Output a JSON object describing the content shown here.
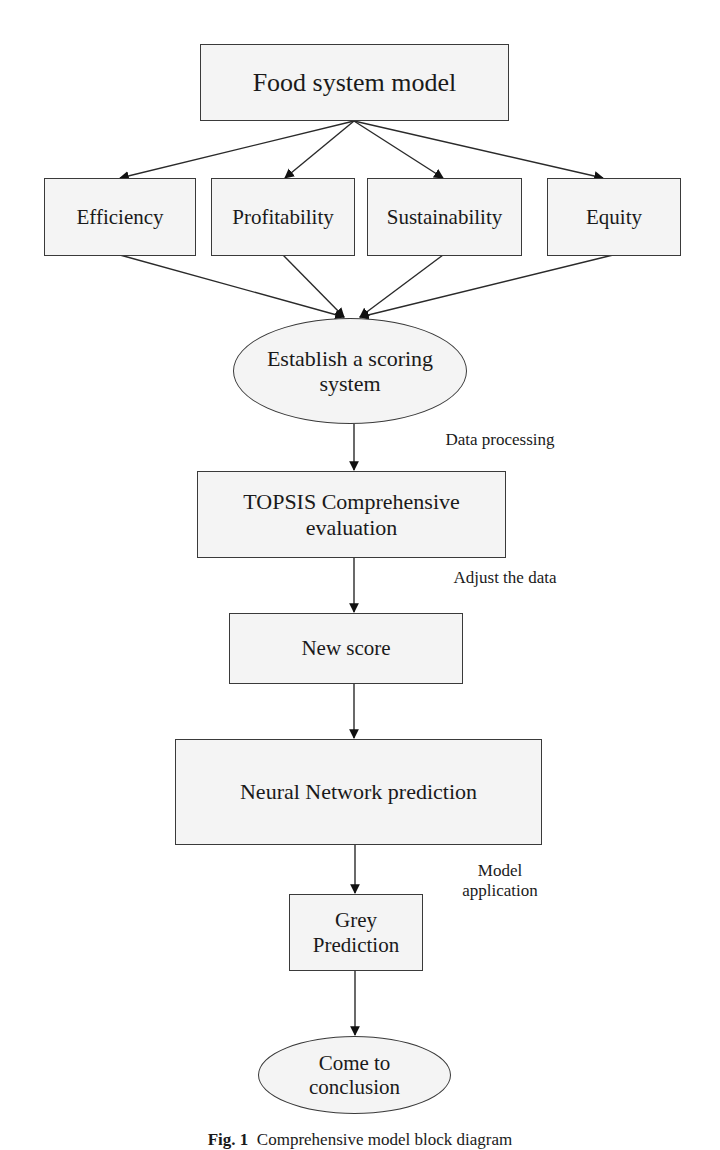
{
  "diagram": {
    "title": "Food system model",
    "criteria": [
      {
        "label": "Efficiency"
      },
      {
        "label": "Profitability"
      },
      {
        "label": "Sustainability"
      },
      {
        "label": "Equity"
      }
    ],
    "steps": {
      "scoring": {
        "line1": "Establish a scoring",
        "line2": "system"
      },
      "topsis": {
        "line1": "TOPSIS Comprehensive",
        "line2": "evaluation"
      },
      "new_score": "New score",
      "neural": "Neural Network prediction",
      "grey": {
        "line1": "Grey",
        "line2": "Prediction"
      },
      "conclusion": {
        "line1": "Come to",
        "line2": "conclusion"
      }
    },
    "edge_labels": {
      "data_processing": "Data processing",
      "adjust_data": "Adjust the data",
      "model_application_line1": "Model",
      "model_application_line2": "application"
    },
    "caption": {
      "prefix": "Fig. 1",
      "text": "Comprehensive model block diagram"
    },
    "colors": {
      "node_fill": "#f4f4f4",
      "stroke": "#3a3a3a",
      "text": "#1a1a1a"
    }
  }
}
